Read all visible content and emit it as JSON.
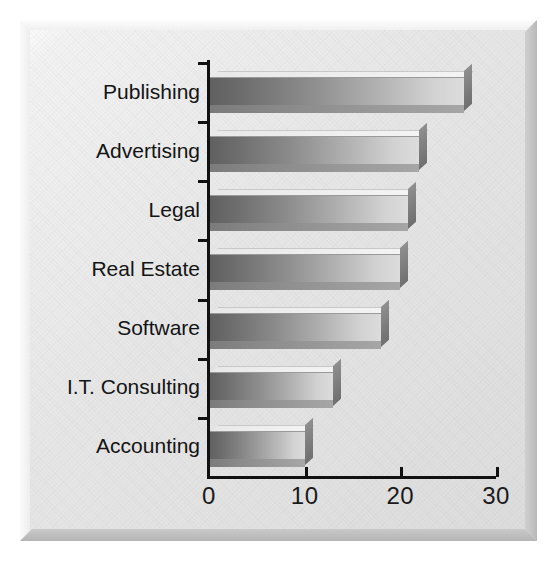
{
  "chart_data": {
    "type": "bar",
    "orientation": "horizontal",
    "title": "",
    "subtitle": "",
    "xlabel": "",
    "ylabel": "",
    "categories": [
      "Publishing",
      "Advertising",
      "Legal",
      "Real Estate",
      "Software",
      "I.T. Consulting",
      "Accounting"
    ],
    "values": [
      26.7,
      22.0,
      20.8,
      20.0,
      18.0,
      13.0,
      10.0
    ],
    "xlim": [
      0,
      30
    ],
    "xticks": [
      0,
      10,
      20,
      30
    ],
    "xtick_labels": [
      "0",
      "10",
      "20",
      "30"
    ],
    "grid": false,
    "legend": null,
    "style": "3d-beveled-gray"
  },
  "axis": {
    "x_tick_labels": [
      "0",
      "10",
      "20",
      "30"
    ],
    "category_labels": [
      "Publishing",
      "Advertising",
      "Legal",
      "Real Estate",
      "Software",
      "I.T. Consulting",
      "Accounting"
    ]
  },
  "colors": {
    "panel_light": "#f2f2f2",
    "panel_shadow": "#b9b9b9",
    "axis": "#111111",
    "bar_dark": "#5f5f5f",
    "bar_light": "#dcdcdc",
    "bar_shadow": "#8a8a8a",
    "text": "#141414"
  }
}
